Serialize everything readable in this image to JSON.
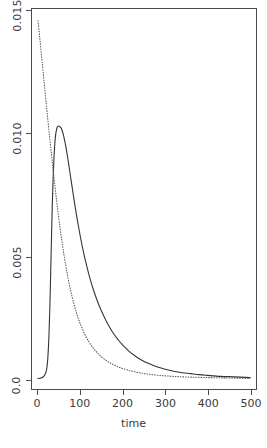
{
  "chart_data": {
    "type": "line",
    "title": "",
    "subtitle": "",
    "xlabel": "time",
    "ylabel": "",
    "xlim": [
      0,
      500
    ],
    "ylim": [
      0.0,
      0.015
    ],
    "grid": false,
    "legend": null,
    "x_ticks": [
      {
        "value": 0,
        "label": "0"
      },
      {
        "value": 100,
        "label": "100"
      },
      {
        "value": 200,
        "label": "200"
      },
      {
        "value": 300,
        "label": "300"
      },
      {
        "value": 400,
        "label": "400"
      },
      {
        "value": 500,
        "label": "500"
      }
    ],
    "y_ticks": [
      {
        "value": 0.0,
        "label": "0.0"
      },
      {
        "value": 0.005,
        "label": "0.005"
      },
      {
        "value": 0.01,
        "label": "0.010"
      },
      {
        "value": 0.015,
        "label": "0.015"
      }
    ],
    "series": [
      {
        "name": "solid-curve",
        "style": "solid",
        "color": "#333333",
        "width": 1.1,
        "peak": {
          "x": 55,
          "y": 0.0103
        },
        "x": [
          0,
          5,
          10,
          14,
          17,
          20,
          22,
          24,
          26,
          28,
          30,
          32,
          34,
          36,
          38,
          40,
          42,
          44,
          46,
          48,
          50,
          52,
          55,
          58,
          60,
          63,
          66,
          70,
          74,
          78,
          82,
          86,
          90,
          95,
          100,
          105,
          110,
          120,
          130,
          140,
          150,
          160,
          175,
          190,
          200,
          215,
          230,
          245,
          260,
          280,
          300,
          320,
          340,
          360,
          380,
          400,
          430,
          460,
          500
        ],
        "y": [
          2e-05,
          3e-05,
          6e-05,
          0.00012,
          0.0002,
          0.00035,
          0.0006,
          0.00105,
          0.0018,
          0.0029,
          0.0043,
          0.0058,
          0.0072,
          0.0083,
          0.0091,
          0.00965,
          0.00999,
          0.01018,
          0.01028,
          0.01031,
          0.0103,
          0.01028,
          0.01022,
          0.01008,
          0.00995,
          0.00972,
          0.00945,
          0.00903,
          0.00858,
          0.00812,
          0.00766,
          0.00721,
          0.00678,
          0.00627,
          0.0058,
          0.00537,
          0.00497,
          0.00427,
          0.00368,
          0.00318,
          0.00276,
          0.0024,
          0.00194,
          0.00158,
          0.00138,
          0.00113,
          0.00093,
          0.00077,
          0.00064,
          0.0005,
          0.0004,
          0.00032,
          0.00026,
          0.00022,
          0.00018,
          0.00015,
          0.00011,
          9e-05,
          6e-05
        ]
      },
      {
        "name": "dotted-curve",
        "style": "dotted",
        "color": "#555555",
        "width": 1.1,
        "start": {
          "x": 0,
          "y": 0.0146
        },
        "x": [
          0,
          4,
          8,
          12,
          16,
          20,
          24,
          28,
          32,
          36,
          40,
          44,
          48,
          52,
          56,
          60,
          65,
          70,
          75,
          80,
          85,
          90,
          95,
          100,
          110,
          120,
          130,
          140,
          150,
          160,
          170,
          180,
          190,
          200,
          215,
          230,
          245,
          260,
          280,
          300,
          320,
          340,
          360,
          380,
          400,
          430,
          460,
          500
        ],
        "y": [
          0.0146,
          0.01395,
          0.01325,
          0.01255,
          0.01185,
          0.01115,
          0.01045,
          0.00978,
          0.00912,
          0.00848,
          0.00786,
          0.00727,
          0.00671,
          0.00618,
          0.00568,
          0.00521,
          0.00468,
          0.0042,
          0.00377,
          0.00339,
          0.00305,
          0.00275,
          0.00248,
          0.00224,
          0.00184,
          0.00152,
          0.00127,
          0.00107,
          0.0009,
          0.00077,
          0.00066,
          0.00057,
          0.00049,
          0.00043,
          0.00035,
          0.00029,
          0.00024,
          0.0002,
          0.00016,
          0.00013,
          0.00011,
          9e-05,
          8e-05,
          7e-05,
          6e-05,
          5e-05,
          4e-05,
          3e-05
        ]
      }
    ]
  },
  "axes": {
    "x_title": "time"
  }
}
